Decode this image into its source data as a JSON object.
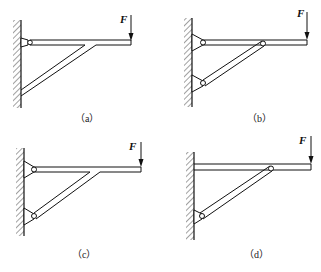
{
  "figure": {
    "panels": [
      {
        "id": "a",
        "caption": "（a）",
        "force_label": "F",
        "description": "Beam rigidly joined to strut; beam pinned to wall, strut fixed to wall"
      },
      {
        "id": "b",
        "caption": "（b）",
        "force_label": "F",
        "description": "Beam and strut both pinned to wall, strut pinned to beam"
      },
      {
        "id": "c",
        "caption": "（c）",
        "force_label": "F",
        "description": "Beam and strut rigidly joined; both pinned to wall"
      },
      {
        "id": "d",
        "caption": "（d）",
        "force_label": "F",
        "description": "Beam fixed to wall; strut pinned to wall and to beam"
      }
    ]
  },
  "colors": {
    "line": "#111111",
    "background": "#ffffff"
  }
}
